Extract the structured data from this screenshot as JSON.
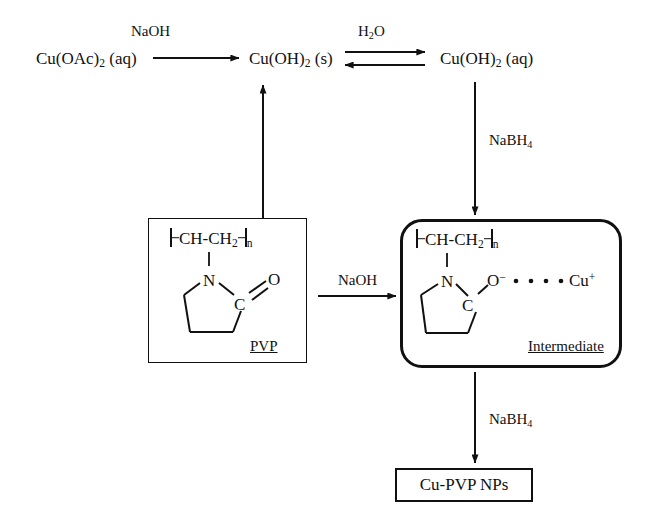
{
  "diagram": {
    "background": "#ffffff",
    "ink": "#111111"
  },
  "species": {
    "copper_acetate": "Cu(OAc)",
    "copper_acetate_sub": "2",
    "copper_acetate_state": " (aq)",
    "copper_hydroxide_solid": "Cu(OH)",
    "copper_hydroxide_solid_sub": "2",
    "copper_hydroxide_solid_state": " (s)",
    "copper_hydroxide_aq": "Cu(OH)",
    "copper_hydroxide_aq_sub": "2",
    "copper_hydroxide_aq_state": " (aq)",
    "product": "Cu-PVP NPs"
  },
  "conditions": {
    "naoh_top": "NaOH",
    "water": "H",
    "water_sub": "2",
    "water_tail": "O",
    "nabh4_right": "NaBH",
    "nabh4_right_sub": "4",
    "naoh_middle": "NaOH",
    "nabh4_bottom": "NaBH",
    "nabh4_bottom_sub": "4"
  },
  "structures": {
    "pvp": {
      "label": "PVP",
      "repeat_open": "",
      "repeat_unit": "CH-CH",
      "repeat_unit_sub": "2",
      "repeat_close_sub": "n",
      "atom_n": "N",
      "atom_c": "C",
      "atom_o": "O",
      "bond_co": "double"
    },
    "intermediate": {
      "label": "Intermediate",
      "repeat_unit": "CH-CH",
      "repeat_unit_sub": "2",
      "repeat_close_sub": "n",
      "atom_n": "N",
      "atom_c": "C",
      "atom_o": "O",
      "atom_o_charge": "−",
      "atom_cu": "Cu",
      "atom_cu_charge": "+",
      "interaction_dots": 4,
      "bond_co": "single"
    }
  }
}
